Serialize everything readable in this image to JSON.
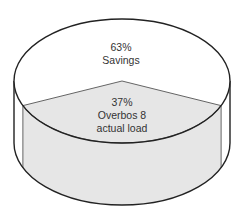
{
  "chart_data": {
    "type": "pie",
    "style": "3d-cylinder",
    "title": "",
    "slices": [
      {
        "label": "Savings",
        "value": 63,
        "display": "63%",
        "color": "#ffffff",
        "lines": [
          "63%",
          "Savings"
        ]
      },
      {
        "label": "Overbos 8 actual load",
        "value": 37,
        "display": "37%",
        "color": "#e6e6e6",
        "lines": [
          "37%",
          "Overbos 8",
          "actual load"
        ]
      }
    ],
    "legend": "none"
  }
}
